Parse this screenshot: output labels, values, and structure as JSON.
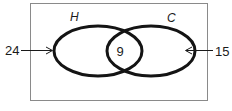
{
  "diagram": {
    "type": "venn",
    "universe": {
      "border_color": "#8a8a8a"
    },
    "sets": [
      {
        "name": "H",
        "label": "H",
        "only_value_label": "24"
      },
      {
        "name": "C",
        "label": "C",
        "only_value_label": "15"
      }
    ],
    "intersection": {
      "sets": [
        "H",
        "C"
      ],
      "label": "9"
    },
    "colors": {
      "stroke": "#141414",
      "text": "#1a1a1a"
    }
  }
}
